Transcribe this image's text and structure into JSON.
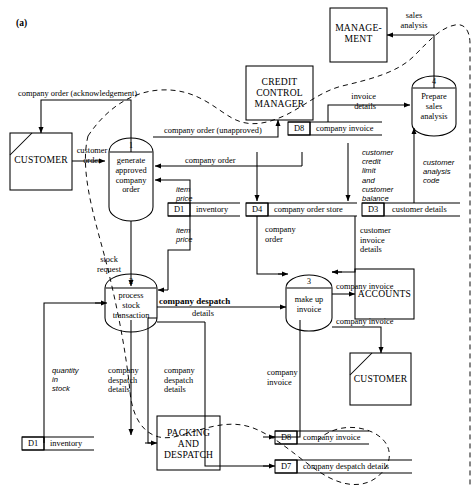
{
  "figure": {
    "label": "(a)",
    "type": "data-flow-diagram"
  },
  "external_entities": [
    {
      "id": "customer-top",
      "name": "CUSTOMER",
      "duplicate_marker": true,
      "x": 10,
      "y": 133,
      "w": 62,
      "h": 57
    },
    {
      "id": "credit-control-manager",
      "name": "CREDIT\nCONTROL\nMANAGER",
      "duplicate_marker": false,
      "x": 246,
      "y": 66,
      "w": 67,
      "h": 54
    },
    {
      "id": "management",
      "name": "MANAGE-\nMENT",
      "duplicate_marker": false,
      "x": 330,
      "y": 8,
      "w": 57,
      "h": 54
    },
    {
      "id": "accounts",
      "name": "ACCOUNTS",
      "duplicate_marker": false,
      "x": 355,
      "y": 269,
      "w": 59,
      "h": 50
    },
    {
      "id": "customer-bottom",
      "name": "CUSTOMER",
      "duplicate_marker": true,
      "x": 350,
      "y": 353,
      "w": 61,
      "h": 52
    },
    {
      "id": "packing-and-despatch",
      "name": "PACKING\nAND\nDESPATCH",
      "duplicate_marker": false,
      "x": 157,
      "y": 416,
      "w": 63,
      "h": 54
    }
  ],
  "processes": [
    {
      "number": "1",
      "name": "generate\napproved\ncompany\norder",
      "cx": 131,
      "cy": 163,
      "w": 44,
      "h": 66
    },
    {
      "number": "2",
      "name": "process\nstock\ntransaction",
      "cx": 131,
      "cy": 303,
      "w": 52,
      "h": 58
    },
    {
      "number": "3",
      "name": "make up\ninvoice",
      "cx": 309,
      "cy": 303,
      "w": 46,
      "h": 58
    },
    {
      "number": "4",
      "name": "Prepare\nsales\nanalysis",
      "cx": 434,
      "cy": 106,
      "w": 44,
      "h": 62
    }
  ],
  "data_stores": [
    {
      "id": "D1",
      "name": "inventory",
      "x": 168,
      "y": 203,
      "w": 72,
      "h": 13
    },
    {
      "id": "D4",
      "name": "company order store",
      "x": 246,
      "y": 203,
      "w": 111,
      "h": 13
    },
    {
      "id": "D3",
      "name": "customer details",
      "x": 362,
      "y": 203,
      "w": 98,
      "h": 13
    },
    {
      "id": "D8",
      "name": "company invoice",
      "x": 288,
      "y": 122,
      "w": 94,
      "h": 13
    },
    {
      "id": "D1",
      "name": "inventory",
      "x": 22,
      "y": 437,
      "w": 72,
      "h": 13
    },
    {
      "id": "D8",
      "name": "company invoice",
      "x": 275,
      "y": 431,
      "w": 94,
      "h": 13
    },
    {
      "id": "D7",
      "name": "company despatch details",
      "x": 275,
      "y": 460,
      "w": 137,
      "h": 13
    }
  ],
  "data_flows": [
    {
      "label": "company order (acknowledgement)",
      "style": "roman",
      "x": 18,
      "y": 89
    },
    {
      "label": "customer\norder",
      "style": "roman",
      "x": 78,
      "y": 146
    },
    {
      "label": "company order (unapproved)",
      "style": "roman",
      "x": 164,
      "y": 126
    },
    {
      "label": "company order",
      "style": "roman",
      "x": 185,
      "y": 156
    },
    {
      "label": "item\nprice",
      "style": "italic",
      "x": 176,
      "y": 185
    },
    {
      "label": "item\nprice",
      "style": "italic",
      "x": 176,
      "y": 226
    },
    {
      "label": "stock\nrequest",
      "style": "roman",
      "x": 102,
      "y": 255
    },
    {
      "label": "company\norder",
      "style": "roman",
      "x": 271,
      "y": 225
    },
    {
      "label": "customer\ncredit\nlimit\nand\ncustomer\nbalance",
      "style": "italic",
      "x": 362,
      "y": 148
    },
    {
      "label": "customer\nanalysis\ncode",
      "style": "italic",
      "x": 425,
      "y": 158
    },
    {
      "label": "customer\ninvoice\ndetails",
      "style": "roman",
      "x": 363,
      "y": 226
    },
    {
      "label": "invoice\ndetails",
      "style": "roman",
      "x": 352,
      "y": 92
    },
    {
      "label": "sales\nanalysis",
      "style": "roman",
      "x": 398,
      "y": 11
    },
    {
      "label": "company despatch",
      "style": "bold",
      "x": 159,
      "y": 297
    },
    {
      "label": "details",
      "style": "roman",
      "x": 187,
      "y": 309
    },
    {
      "label": "company invoice",
      "style": "roman",
      "x": 339,
      "y": 282
    },
    {
      "label": "company invoice",
      "style": "roman",
      "x": 339,
      "y": 317
    },
    {
      "label": "quantity\nin\nstock",
      "style": "italic",
      "x": 52,
      "y": 366
    },
    {
      "label": "company\ndespatch\ndetails",
      "style": "roman",
      "x": 110,
      "y": 366
    },
    {
      "label": "company\ndespatch\ndetails",
      "style": "roman",
      "x": 166,
      "y": 366
    },
    {
      "label": "company\ninvoice",
      "style": "roman",
      "x": 269,
      "y": 368
    }
  ]
}
